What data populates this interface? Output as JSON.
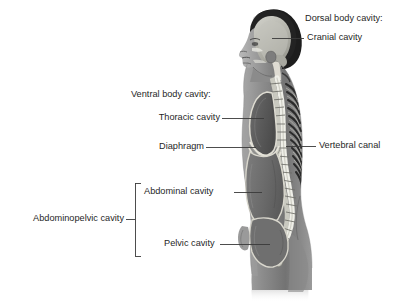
{
  "figure": {
    "background_color": "#ffffff",
    "text_color": "#1f1f1f",
    "leader_line_color": "#3a3a3a",
    "cavity_outline_color": "#d8d8d0",
    "body_tones": {
      "hair_dark": "#1d1d1d",
      "skin_mid": "#8e8e8e",
      "skin_light": "#b5b5b5",
      "torso_shadow": "#5f5f5f",
      "cavity_fill": "#6a6a6a",
      "bone_light": "#e3e3dd",
      "canal_light": "#efefe8"
    }
  },
  "labels": {
    "dorsal_group": {
      "heading": "Dorsal body cavity:",
      "items": [
        {
          "text": "Cranial cavity",
          "target": "cranial-cavity"
        },
        {
          "text": "Vertebral canal",
          "target": "vertebral-canal"
        }
      ]
    },
    "ventral_group": {
      "heading": "Ventral body cavity:",
      "items": [
        {
          "text": "Thoracic cavity",
          "target": "thoracic-cavity"
        },
        {
          "text": "Diaphragm",
          "target": "diaphragm"
        },
        {
          "text": "Abdominal cavity",
          "target": "abdominal-cavity"
        },
        {
          "text": "Pelvic cavity",
          "target": "pelvic-cavity"
        }
      ]
    },
    "bracket_group": {
      "text": "Abdominopelvic cavity",
      "members": [
        "Abdominal cavity",
        "Pelvic cavity"
      ]
    }
  },
  "structures": [
    {
      "name": "cranial-cavity",
      "region": "head"
    },
    {
      "name": "vertebral-canal",
      "region": "spine"
    },
    {
      "name": "thoracic-cavity",
      "region": "chest"
    },
    {
      "name": "diaphragm",
      "region": "mid-torso"
    },
    {
      "name": "abdominal-cavity",
      "region": "abdomen"
    },
    {
      "name": "pelvic-cavity",
      "region": "pelvis"
    }
  ]
}
